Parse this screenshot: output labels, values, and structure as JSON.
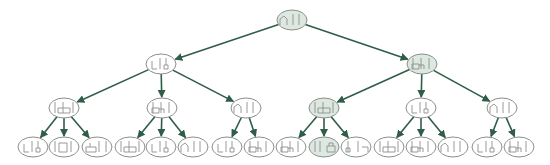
{
  "diagram": {
    "type": "search-tree",
    "colors": {
      "edge": "#2f5d47",
      "node_border": "#8a8f8c",
      "node_fill_default": "#ffffff",
      "node_fill_highlight": "#dde8e1",
      "glyph": "#8f8f8f",
      "accent_red": "#d9a0a0"
    },
    "nodes": [
      {
        "id": "n0",
        "level": 0,
        "x": 292,
        "y": 20,
        "highlight": true,
        "state": "A|"
      },
      {
        "id": "n1",
        "level": 1,
        "x": 161,
        "y": 64,
        "highlight": false,
        "state": "B"
      },
      {
        "id": "n2",
        "level": 1,
        "x": 422,
        "y": 64,
        "highlight": true,
        "state": "C"
      },
      {
        "id": "n3",
        "level": 2,
        "x": 64,
        "y": 108,
        "highlight": false,
        "state": "D"
      },
      {
        "id": "n4",
        "level": 2,
        "x": 162,
        "y": 108,
        "highlight": false,
        "state": "C"
      },
      {
        "id": "n5",
        "level": 2,
        "x": 246,
        "y": 108,
        "highlight": false,
        "state": "A|"
      },
      {
        "id": "n6",
        "level": 2,
        "x": 324,
        "y": 108,
        "highlight": true,
        "state": "D"
      },
      {
        "id": "n7",
        "level": 2,
        "x": 421,
        "y": 108,
        "highlight": false,
        "state": "B"
      },
      {
        "id": "n8",
        "level": 2,
        "x": 502,
        "y": 108,
        "highlight": false,
        "state": "A|"
      },
      {
        "id": "n9",
        "level": 3,
        "x": 33,
        "y": 147,
        "highlight": false,
        "state": "B"
      },
      {
        "id": "n10",
        "level": 3,
        "x": 64,
        "y": 147,
        "highlight": false,
        "state": "E"
      },
      {
        "id": "n11",
        "level": 3,
        "x": 97,
        "y": 147,
        "highlight": false,
        "state": "F"
      },
      {
        "id": "n12",
        "level": 3,
        "x": 130,
        "y": 147,
        "highlight": false,
        "state": "D"
      },
      {
        "id": "n13",
        "level": 3,
        "x": 161,
        "y": 147,
        "highlight": false,
        "state": "B"
      },
      {
        "id": "n14",
        "level": 3,
        "x": 193,
        "y": 147,
        "highlight": false,
        "state": "A|"
      },
      {
        "id": "n15",
        "level": 3,
        "x": 227,
        "y": 147,
        "highlight": false,
        "state": "B"
      },
      {
        "id": "n16",
        "level": 3,
        "x": 259,
        "y": 147,
        "highlight": false,
        "state": "C"
      },
      {
        "id": "n17",
        "level": 3,
        "x": 291,
        "y": 147,
        "highlight": false,
        "state": "C"
      },
      {
        "id": "n18",
        "level": 3,
        "x": 324,
        "y": 147,
        "highlight": true,
        "state": "G"
      },
      {
        "id": "n19",
        "level": 3,
        "x": 356,
        "y": 147,
        "highlight": false,
        "state": "H"
      },
      {
        "id": "n20",
        "level": 3,
        "x": 389,
        "y": 147,
        "highlight": false,
        "state": "D"
      },
      {
        "id": "n21",
        "level": 3,
        "x": 421,
        "y": 147,
        "highlight": false,
        "state": "C"
      },
      {
        "id": "n22",
        "level": 3,
        "x": 453,
        "y": 147,
        "highlight": false,
        "state": "A|"
      },
      {
        "id": "n23",
        "level": 3,
        "x": 487,
        "y": 147,
        "highlight": false,
        "state": "B"
      },
      {
        "id": "n24",
        "level": 3,
        "x": 519,
        "y": 147,
        "highlight": false,
        "state": "C"
      }
    ],
    "edges": [
      [
        "n0",
        "n1"
      ],
      [
        "n0",
        "n2"
      ],
      [
        "n1",
        "n3"
      ],
      [
        "n1",
        "n4"
      ],
      [
        "n1",
        "n5"
      ],
      [
        "n2",
        "n6"
      ],
      [
        "n2",
        "n7"
      ],
      [
        "n2",
        "n8"
      ],
      [
        "n3",
        "n9"
      ],
      [
        "n3",
        "n10"
      ],
      [
        "n3",
        "n11"
      ],
      [
        "n4",
        "n12"
      ],
      [
        "n4",
        "n13"
      ],
      [
        "n4",
        "n14"
      ],
      [
        "n5",
        "n15"
      ],
      [
        "n5",
        "n16"
      ],
      [
        "n6",
        "n17"
      ],
      [
        "n6",
        "n18"
      ],
      [
        "n6",
        "n19"
      ],
      [
        "n7",
        "n20"
      ],
      [
        "n7",
        "n21"
      ],
      [
        "n7",
        "n22"
      ],
      [
        "n8",
        "n23"
      ],
      [
        "n8",
        "n24"
      ]
    ],
    "node_size": {
      "rx": 15,
      "ry": 10
    }
  }
}
